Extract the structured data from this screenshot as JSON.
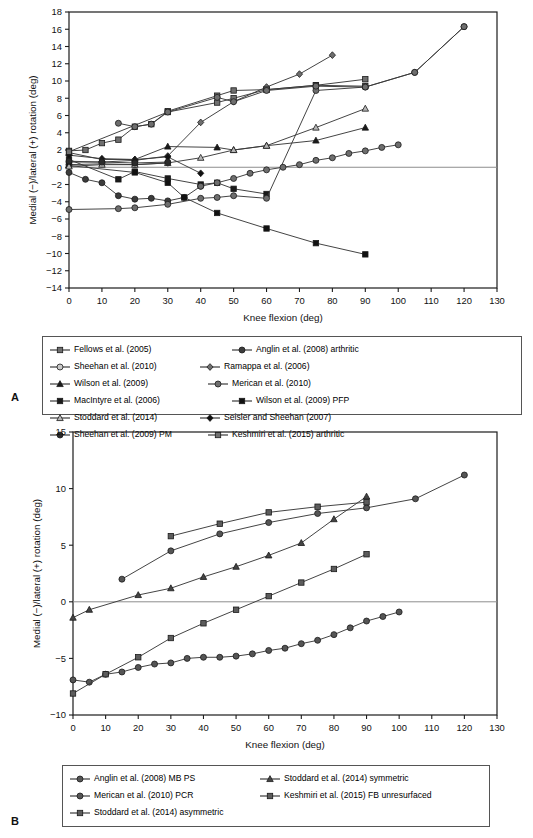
{
  "figure": {
    "panel_a_letter": "A",
    "panel_b_letter": "B"
  },
  "chart_data": [
    {
      "id": "panel-a",
      "type": "line",
      "title": "",
      "xlabel": "Knee flexion (deg)",
      "ylabel": "Medial (−)/lateral (+) rotation (deg)",
      "xlim": [
        0,
        130
      ],
      "ylim": [
        -14,
        18
      ],
      "xticks": [
        0,
        10,
        20,
        30,
        40,
        50,
        60,
        70,
        80,
        90,
        100,
        110,
        120,
        130
      ],
      "yticks": [
        -14,
        -12,
        -10,
        -8,
        -6,
        -4,
        -2,
        0,
        2,
        4,
        6,
        8,
        10,
        12,
        14,
        16,
        18
      ],
      "grid": false,
      "zero_line": true,
      "legend_position": "below",
      "series": [
        {
          "name": "Fellows et al. (2005)",
          "marker": "square",
          "fill": "#6e6e6e",
          "x": [
            0,
            5,
            10,
            15,
            20,
            25,
            30,
            45,
            50,
            60,
            75,
            90
          ],
          "y": [
            1.9,
            2.0,
            2.8,
            3.2,
            4.7,
            5.0,
            6.5,
            8.3,
            8.9,
            9.0,
            9.5,
            10.2
          ]
        },
        {
          "name": "Ramappa et al. (2006)",
          "marker": "diamond",
          "fill": "#6e6e6e",
          "x": [
            0,
            10,
            20,
            30,
            40,
            50,
            60,
            70,
            80
          ],
          "y": [
            0.6,
            0.6,
            0.8,
            1.3,
            5.2,
            7.6,
            9.3,
            10.8,
            13.0
          ]
        },
        {
          "name": "MacIntyre et al. (2006)",
          "marker": "square",
          "fill": "#1a1a1a",
          "x": [
            0,
            15,
            20,
            30,
            40,
            45,
            50,
            60
          ],
          "y": [
            0.9,
            -1.4,
            -0.5,
            -1.3,
            -2.0,
            -1.8,
            -2.5,
            -3.1
          ]
        },
        {
          "name": "Seisler and Sheehan (2007)",
          "marker": "diamond",
          "fill": "#111111",
          "x": [
            0,
            10,
            20,
            30,
            40
          ],
          "y": [
            1.4,
            1.0,
            0.9,
            1.2,
            -0.7
          ]
        },
        {
          "name": "Anglin et al. (2008) arthritic",
          "marker": "circle",
          "fill": "#3c3c3c",
          "x": [
            0,
            5,
            10,
            15,
            20,
            25,
            30,
            35,
            40
          ],
          "y": [
            -0.6,
            -1.4,
            -1.8,
            -3.3,
            -3.7,
            -3.6,
            -3.9,
            -3.5,
            -2.2
          ]
        },
        {
          "name": "Sheehan et al. (2010)",
          "marker": "circle-open",
          "fill": "#9a9a9a",
          "x": [
            0,
            10,
            20,
            30
          ],
          "y": [
            0.3,
            0.4,
            0.3,
            0.5
          ]
        },
        {
          "name": "Wilson et al. (2009)",
          "marker": "triangle",
          "fill": "#1a1a1a",
          "x": [
            0,
            10,
            20,
            30,
            45,
            50,
            60,
            75,
            90
          ],
          "y": [
            1.7,
            0.9,
            0.9,
            2.4,
            2.3,
            2.0,
            2.5,
            3.1,
            4.6
          ]
        },
        {
          "name": "Merican et al. (2010)",
          "marker": "circle",
          "fill": "#6e6e6e",
          "x": [
            0,
            15,
            20,
            30,
            40,
            45,
            50,
            60,
            75,
            90,
            105,
            120
          ],
          "y": [
            -4.9,
            -4.8,
            -4.7,
            -4.3,
            -3.6,
            -3.5,
            -3.3,
            -3.6,
            8.9,
            9.3,
            11.0,
            16.3
          ]
        },
        {
          "name": "Wilson et al. (2009) PFP",
          "marker": "square",
          "fill": "#111111",
          "x": [
            0,
            20,
            30,
            35,
            45,
            60,
            75,
            90
          ],
          "y": [
            0.2,
            -0.6,
            -1.8,
            -3.5,
            -5.3,
            -7.1,
            -8.8,
            -10.1
          ]
        },
        {
          "name": "Stoddard et al. (2014)",
          "marker": "triangle-open",
          "fill": "#a9a9a9",
          "x": [
            0,
            10,
            20,
            30,
            40,
            50,
            60,
            75,
            90
          ],
          "y": [
            0.1,
            0.3,
            0.3,
            0.5,
            1.1,
            2.0,
            2.5,
            4.6,
            6.8
          ]
        },
        {
          "name": "Sheehan et al. (2009) PM",
          "marker": "circle",
          "fill": "#2b2b2b",
          "x": [
            0,
            10,
            20,
            30
          ],
          "y": [
            0.7,
            0.6,
            0.5,
            0.6
          ]
        },
        {
          "name": "Keshmiri et al. (2015) arthritic",
          "marker": "square",
          "fill": "#707070",
          "x": [
            0,
            30,
            45,
            50,
            60,
            75,
            90
          ],
          "y": [
            1.8,
            6.4,
            7.5,
            8.0,
            9.0,
            9.5,
            9.4
          ]
        },
        {
          "name": "Merican et al. (2010) upper",
          "marker": "circle",
          "fill": "#6e6e6e",
          "hide_legend": true,
          "x": [
            15,
            20,
            25,
            30,
            45,
            50,
            60,
            75,
            90,
            105,
            120
          ],
          "y": [
            5.1,
            4.7,
            5.0,
            6.4,
            8.1,
            7.6,
            8.9,
            9.4,
            9.3,
            11.0,
            16.3
          ]
        },
        {
          "name": "Anglin low track",
          "marker": "circle",
          "fill": "#6e6e6e",
          "hide_legend": true,
          "x": [
            40,
            45,
            50,
            55,
            60,
            65,
            70,
            75,
            80,
            85,
            90,
            95,
            100
          ],
          "y": [
            -2.2,
            -1.8,
            -1.3,
            -0.7,
            -0.3,
            0.0,
            0.3,
            0.8,
            1.1,
            1.6,
            1.9,
            2.3,
            2.6
          ]
        }
      ]
    },
    {
      "id": "panel-b",
      "type": "line",
      "title": "",
      "xlabel": "Knee flexion (deg)",
      "ylabel": "Medial (−)/lateral (+) rotation (deg)",
      "xlim": [
        0,
        130
      ],
      "ylim": [
        -10,
        15
      ],
      "xticks": [
        0,
        10,
        20,
        30,
        40,
        50,
        60,
        70,
        80,
        90,
        100,
        110,
        120,
        130
      ],
      "yticks": [
        -10,
        -5,
        0,
        5,
        10,
        15
      ],
      "grid": false,
      "zero_line": true,
      "legend_position": "below",
      "series": [
        {
          "name": "Anglin et al. (2008) MB PS",
          "marker": "circle",
          "fill": "#555555",
          "x": [
            15,
            30,
            45,
            60,
            75,
            90,
            105,
            120
          ],
          "y": [
            2.0,
            4.5,
            6.0,
            7.0,
            7.8,
            8.3,
            9.1,
            11.2
          ]
        },
        {
          "name": "Stoddard et al. (2014) symmetric",
          "marker": "triangle",
          "fill": "#444444",
          "x": [
            0,
            5,
            20,
            30,
            40,
            50,
            60,
            70,
            80,
            90
          ],
          "y": [
            -1.4,
            -0.7,
            0.6,
            1.2,
            2.2,
            3.1,
            4.1,
            5.2,
            7.3,
            9.3
          ]
        },
        {
          "name": "Merican et al. (2010) PCR",
          "marker": "circle",
          "fill": "#555555",
          "x": [
            0,
            5,
            10,
            15,
            20,
            25,
            30,
            35,
            40,
            45,
            50,
            55,
            60,
            65,
            70,
            75,
            80,
            85,
            90,
            95,
            100
          ],
          "y": [
            -6.9,
            -7.1,
            -6.4,
            -6.2,
            -5.8,
            -5.5,
            -5.4,
            -5.0,
            -4.9,
            -4.9,
            -4.8,
            -4.6,
            -4.3,
            -4.1,
            -3.7,
            -3.4,
            -2.9,
            -2.3,
            -1.7,
            -1.3,
            -0.9
          ]
        },
        {
          "name": "Keshmiri et al. (2015) FB unresurfaced",
          "marker": "square",
          "fill": "#5c5c5c",
          "x": [
            0,
            10,
            20,
            30,
            40,
            50,
            60,
            70,
            80,
            90
          ],
          "y": [
            -8.1,
            -6.4,
            -4.9,
            -3.2,
            -1.9,
            -0.7,
            0.5,
            1.7,
            2.9,
            4.2
          ]
        },
        {
          "name": "Stoddard et al. (2014) asymmetric",
          "marker": "square",
          "fill": "#5c5c5c",
          "x": [
            30,
            45,
            60,
            75,
            90
          ],
          "y": [
            5.8,
            6.9,
            7.9,
            8.4,
            8.8
          ]
        }
      ]
    }
  ]
}
